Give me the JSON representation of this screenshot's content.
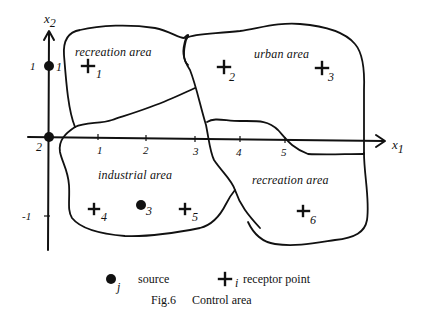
{
  "figure": {
    "caption_number": "Fig.6",
    "caption_title": "Control area"
  },
  "axes": {
    "x_label": "x",
    "x_label_sub": "1",
    "y_label": "x",
    "y_label_sub": "2",
    "x_ticks": [
      "1",
      "2",
      "3",
      "4",
      "5"
    ],
    "y_ticks": [
      "1",
      "-1"
    ]
  },
  "areas": [
    {
      "label": "recreation area",
      "position": "top-left"
    },
    {
      "label": "urban area",
      "position": "top-right"
    },
    {
      "label": "industrial area",
      "position": "bottom-left"
    },
    {
      "label": "recreation area",
      "position": "bottom-right"
    }
  ],
  "sources": [
    {
      "index": "1",
      "x": 0,
      "y": 1
    },
    {
      "index": "2",
      "x": 0,
      "y": 0
    },
    {
      "index": "3",
      "x": 2,
      "y": -0.8
    }
  ],
  "receptors": [
    {
      "index": "1",
      "x": 0.8,
      "y": 1
    },
    {
      "index": "2",
      "x": 3.6,
      "y": 1
    },
    {
      "index": "3",
      "x": 5.6,
      "y": 1
    },
    {
      "index": "4",
      "x": 0.9,
      "y": -0.9
    },
    {
      "index": "5",
      "x": 2.8,
      "y": -0.9
    },
    {
      "index": "6",
      "x": 5.4,
      "y": -1
    }
  ],
  "legend": {
    "source_symbol_sub": "j",
    "source_label": "source",
    "receptor_symbol_sub": "i",
    "receptor_label": "receptor point"
  }
}
